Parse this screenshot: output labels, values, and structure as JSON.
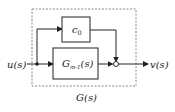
{
  "diagram": {
    "type": "block-diagram",
    "input_label": "u(s)",
    "output_label": "v(s)",
    "system_label": "G(s)",
    "blocks": [
      {
        "id": "upper",
        "label_main": "c",
        "label_sub": "0"
      },
      {
        "id": "lower",
        "label_main": "G",
        "label_sub": "m-1",
        "label_tail": "(s)"
      }
    ],
    "junctions": [
      {
        "id": "branch-point",
        "kind": "pickoff"
      },
      {
        "id": "summing-junction",
        "kind": "sum"
      }
    ],
    "colors": {
      "line": "#222222",
      "dashed_box": "#888888",
      "background": "#ffffff"
    }
  }
}
